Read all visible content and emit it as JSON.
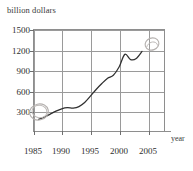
{
  "chart": {
    "ylabel": "billion dollars",
    "xlabel": "year",
    "yticks": [
      "1500",
      "1200",
      "900",
      "600",
      "300"
    ],
    "xticks": [
      "1985",
      "1990",
      "1995",
      "2000",
      "2005"
    ]
  },
  "annotations": [
    {
      "name": "pencil-circle-start",
      "label": ""
    },
    {
      "name": "pencil-circle-end",
      "label": ""
    }
  ],
  "chart_data": {
    "type": "line",
    "title": "",
    "subtitle": "",
    "xlabel": "year",
    "ylabel": "billion dollars",
    "xlim": [
      1984,
      2007
    ],
    "ylim": [
      180,
      1560
    ],
    "xticks": [
      1985,
      1990,
      1995,
      2000,
      2005
    ],
    "yticks": [
      300,
      600,
      900,
      1200,
      1500
    ],
    "grid": true,
    "legend": false,
    "legend_position": "none",
    "units": "billion dollars",
    "x": [
      1985,
      1986,
      1987,
      1988,
      1989,
      1990,
      1991,
      1992,
      1993,
      1994,
      1995,
      1996,
      1997,
      1998,
      1999,
      2000,
      2001,
      2002,
      2003
    ],
    "series": [
      {
        "name": "value",
        "values": [
          350,
          380,
          420,
          460,
          490,
          505,
          500,
          520,
          575,
          660,
          750,
          830,
          900,
          940,
          1050,
          1220,
          1150,
          1165,
          1260
        ]
      }
    ],
    "annotations": [
      {
        "type": "hand-drawn-circle",
        "x": 1985,
        "y": 350,
        "text": ""
      },
      {
        "type": "hand-drawn-circle",
        "x": 2003,
        "y": 1260,
        "text": ""
      }
    ]
  }
}
